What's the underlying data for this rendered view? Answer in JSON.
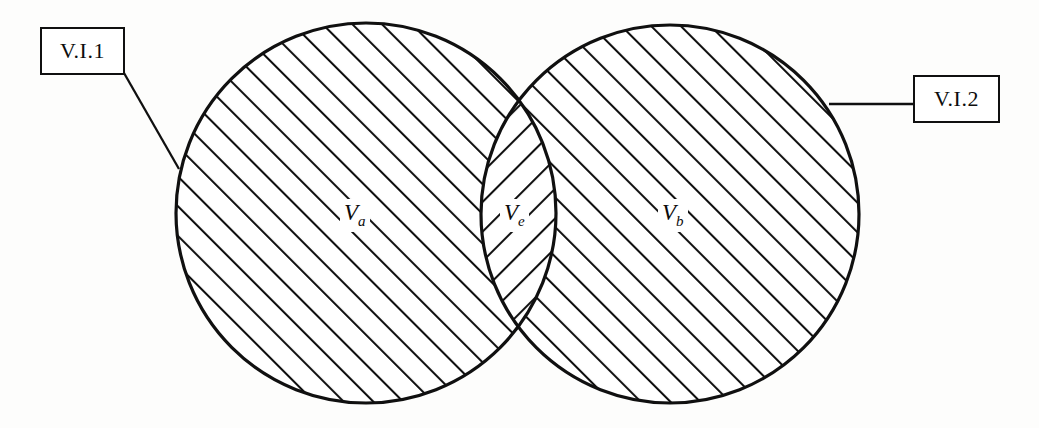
{
  "figure": {
    "type": "venn-diagram",
    "background_color": "#fdfdfc",
    "stroke_color": "#101010"
  },
  "callouts": [
    {
      "id": "vi1",
      "label": "V.I.1",
      "points_to": "left-circle",
      "leader_style": "diagonal"
    },
    {
      "id": "vi2",
      "label": "V.I.2",
      "points_to": "right-circle",
      "leader_style": "horizontal"
    }
  ],
  "regions": [
    {
      "id": "va",
      "symbol": "V",
      "subscript": "a",
      "description": "left circle region"
    },
    {
      "id": "ve",
      "symbol": "V",
      "subscript": "e",
      "description": "intersection lens region"
    },
    {
      "id": "vb",
      "symbol": "V",
      "subscript": "b",
      "description": "right circle region"
    }
  ],
  "geometry": {
    "left_circle": {
      "cx": 366,
      "cy": 213,
      "r": 190
    },
    "right_circle": {
      "cx": 670,
      "cy": 214,
      "r": 189
    },
    "lens_top_vertex": {
      "x": 520,
      "y": 98
    },
    "lens_bottom_vertex": {
      "x": 520,
      "y": 330
    },
    "hatch_angle_circles": 45,
    "hatch_angle_lens": -45,
    "hatch_spacing": 21
  }
}
